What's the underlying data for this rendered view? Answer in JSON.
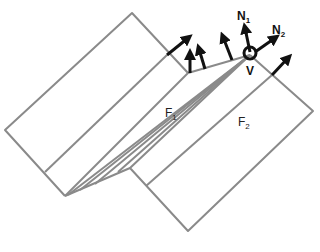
{
  "diagram": {
    "type": "folded-paper-vertex",
    "faces": [
      {
        "id": "F1",
        "label": "F",
        "subscript": "1"
      },
      {
        "id": "F2",
        "label": "F",
        "subscript": "2"
      }
    ],
    "normals": [
      {
        "id": "N1",
        "label": "N",
        "subscript": "1"
      },
      {
        "id": "N2",
        "label": "N",
        "subscript": "2"
      }
    ],
    "vertex": {
      "id": "V",
      "label": "V"
    },
    "colors": {
      "edge": "#8a8a8a",
      "arrow": "#111111",
      "background": "#ffffff"
    }
  }
}
